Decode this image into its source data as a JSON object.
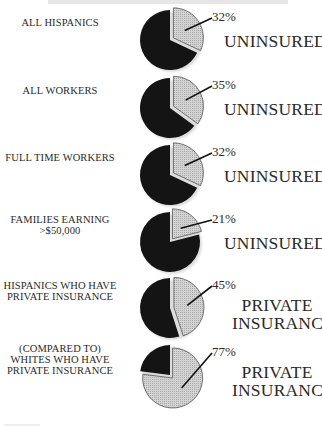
{
  "chart_data": {
    "type": "pie",
    "title": "",
    "charts": [
      {
        "label": "ALL HISPANICS",
        "value": 32,
        "value_label": "32%",
        "category": "UNINSURED"
      },
      {
        "label": "ALL WORKERS",
        "value": 35,
        "value_label": "35%",
        "category": "UNINSURED"
      },
      {
        "label": "FULL TIME WORKERS",
        "value": 32,
        "value_label": "32%",
        "category": "UNINSURED"
      },
      {
        "label": "FAMILIES EARNING >$50,000",
        "value": 21,
        "value_label": "21%",
        "category": "UNINSURED"
      },
      {
        "label": "HISPANICS WHO HAVE PRIVATE INSURANCE",
        "value": 45,
        "value_label": "45%",
        "category": "PRIVATE INSURANCE"
      },
      {
        "label": "(COMPARED TO) WHITES WHO HAVE PRIVATE INSURANCE",
        "value": 77,
        "value_label": "77%",
        "category": "PRIVATE INSURANCE"
      }
    ],
    "legend": null
  },
  "colors": {
    "highlight_slice": "#c9c9c9",
    "remainder_slice": "#141414",
    "slice_outline": "#555555"
  },
  "rows": [
    {
      "label_lines": [
        "ALL HISPANICS"
      ],
      "pct": "32%",
      "value": 32,
      "category_lines": [
        "UNINSURED"
      ]
    },
    {
      "label_lines": [
        "ALL WORKERS"
      ],
      "pct": "35%",
      "value": 35,
      "category_lines": [
        "UNINSURED"
      ]
    },
    {
      "label_lines": [
        "FULL TIME WORKERS"
      ],
      "pct": "32%",
      "value": 32,
      "category_lines": [
        "UNINSURED"
      ]
    },
    {
      "label_lines": [
        "FAMILIES EARNING",
        ">$50,000"
      ],
      "pct": "21%",
      "value": 21,
      "category_lines": [
        "UNINSURED"
      ]
    },
    {
      "label_lines": [
        "HISPANICS WHO HAVE",
        "PRIVATE INSURANCE"
      ],
      "pct": "45%",
      "value": 45,
      "category_lines": [
        "PRIVATE",
        "INSURANCE"
      ]
    },
    {
      "label_lines": [
        "(COMPARED TO)",
        "WHITES WHO HAVE",
        "PRIVATE INSURANCE"
      ],
      "pct": "77%",
      "value": 77,
      "category_lines": [
        "PRIVATE",
        "INSURANCE"
      ]
    }
  ]
}
